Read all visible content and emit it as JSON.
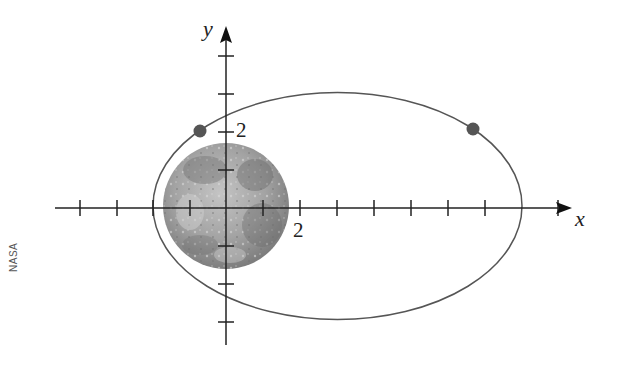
{
  "figure": {
    "type": "orbit-diagram",
    "credit": "NASA",
    "axes": {
      "x_label": "x",
      "y_label": "y",
      "x_tick_label": "2",
      "y_tick_label": "2",
      "x_ticks": [
        -4,
        -3,
        -2,
        -1,
        1,
        2,
        3,
        4,
        5,
        6,
        7,
        8,
        9
      ],
      "y_ticks": [
        -3,
        -2,
        -1,
        1,
        2,
        3,
        4
      ]
    },
    "orbit": {
      "shape": "ellipse",
      "stroke_color": "#555555"
    },
    "moon": {
      "label": "Moon",
      "fill_color": "#9a9a9a"
    },
    "points": [
      {
        "name": "left-point",
        "color": "#555555"
      },
      {
        "name": "right-point",
        "color": "#555555"
      }
    ]
  }
}
